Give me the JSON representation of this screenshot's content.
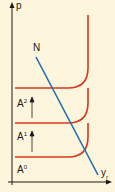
{
  "diagram": {
    "y_axis_label": "p",
    "x_axis_label_main": "y",
    "x_axis_label_sub": "r",
    "line_label": "N",
    "curves": [
      {
        "label_main": "A",
        "label_sup": "2"
      },
      {
        "label_main": "A",
        "label_sup": "1"
      },
      {
        "label_main": "A",
        "label_sup": "0"
      }
    ],
    "colors": {
      "background": "#fdf6dc",
      "curve": "#d9381e",
      "line": "#1f6fb2",
      "axis": "#1a1a1a"
    }
  }
}
